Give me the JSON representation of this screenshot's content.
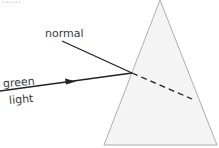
{
  "diagram": {
    "type": "optics-refraction",
    "labels": {
      "normal": "normal",
      "ray_line1": "green",
      "ray_line2": "light",
      "top_cut_text": "......"
    },
    "colors": {
      "prism_fill": "#f4f4f4",
      "prism_stroke": "#9a9a9a",
      "ray": "#222222",
      "text": "#3a3a3a"
    },
    "elements": {
      "prism": {
        "apex": [
          160,
          0
        ],
        "base_left": [
          104,
          145
        ],
        "base_right": [
          217,
          145
        ]
      },
      "incident_ray": {
        "from": [
          0,
          91
        ],
        "to": [
          132,
          73
        ],
        "arrow_at": [
          72,
          82
        ]
      },
      "normal_line": {
        "from": [
          62,
          41
        ],
        "to": [
          132,
          73
        ]
      },
      "refracted_ray": {
        "from": [
          132,
          73
        ],
        "to": [
          192,
          99
        ],
        "style": "dashed"
      }
    }
  }
}
